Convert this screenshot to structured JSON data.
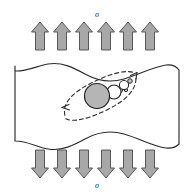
{
  "figure": {
    "type": "materials-science-schematic",
    "background_color": "#ffffff",
    "width": 194,
    "height": 193
  },
  "labels": {
    "top_stress": "σ",
    "bottom_stress": "σ"
  },
  "colors": {
    "arrow_fill": "#a8a8a8",
    "arrow_stroke": "#4a4a4a",
    "body_stroke": "#2b2b2b",
    "body_fill": "#ffffff",
    "inclusion_fill": "#b5b5b5",
    "inclusion_stroke": "#1f1f1f",
    "void_fill": "#ffffff",
    "void_stroke": "#1f1f1f",
    "microvoid_fill": "#c0c0c0",
    "dashed_stroke": "#2b2b2b",
    "label_color": "#1a1a1a"
  },
  "top_arrows": {
    "direction": "up",
    "count": 6,
    "label": "σ",
    "x_positions": [
      40,
      62,
      84,
      106,
      128,
      150
    ],
    "y_top": 22,
    "y_bottom": 50,
    "shaft_width": 9,
    "head_width": 17
  },
  "bottom_arrows": {
    "direction": "down",
    "count": 6,
    "label": "σ",
    "x_positions": [
      40,
      62,
      84,
      106,
      128,
      150
    ],
    "y_top": 150,
    "y_bottom": 178,
    "shaft_width": 9,
    "head_width": 17
  },
  "body": {
    "name": "specimen-body",
    "left": 14,
    "right": 180,
    "top_wave_peak_y": 57,
    "top_wave_trough_y": 71,
    "bottom_wave_peak_y": 136,
    "bottom_wave_trough_y": 150,
    "description": "rectangular specimen with wavy fractured top and bottom surfaces"
  },
  "inclusion": {
    "name": "primary-inclusion",
    "cx": 97,
    "cy": 96,
    "r": 12.5,
    "fill": "#b5b5b5"
  },
  "voids": [
    {
      "name": "void-1",
      "cx": 114,
      "cy": 92,
      "r": 7.0,
      "fill": "#ffffff"
    },
    {
      "name": "void-2",
      "cx": 124,
      "cy": 85,
      "r": 4.6,
      "fill": "#ffffff"
    },
    {
      "name": "microvoid-1",
      "cx": 120,
      "cy": 90,
      "r": 2.6,
      "fill": "#c0c0c0"
    },
    {
      "name": "microvoid-2",
      "cx": 130,
      "cy": 81,
      "r": 2.3,
      "fill": "#c0c0c0"
    },
    {
      "name": "microvoid-3",
      "cx": 126,
      "cy": 90,
      "r": 1.7,
      "fill": "#c0c0c0"
    }
  ],
  "crack_path": {
    "name": "dashed-crack-envelope",
    "style": "dashed",
    "dash_pattern": "4 3",
    "arrowheads": [
      "lower-left",
      "upper-right"
    ],
    "rotation_deg": -26,
    "cx": 100,
    "cy": 96,
    "rx": 42,
    "ry": 15
  }
}
